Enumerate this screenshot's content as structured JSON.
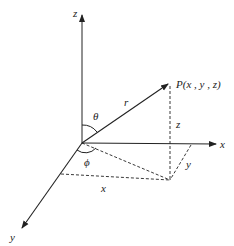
{
  "diagram": {
    "labels": {
      "z_axis": "z",
      "x_axis": "x",
      "y_axis": "y",
      "point": "P(x , y , z)",
      "r": "r",
      "theta": "θ",
      "phi": "ϕ",
      "z_dim": "z",
      "y_dim": "y",
      "x_dim": "x"
    },
    "colors": {
      "stroke": "#222222",
      "background": "#ffffff"
    }
  }
}
